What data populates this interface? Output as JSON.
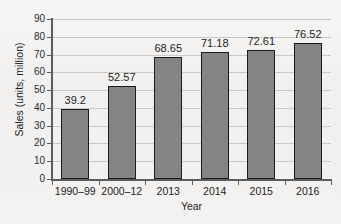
{
  "chart_data": {
    "type": "bar",
    "title": "",
    "subtitle": "",
    "xlabel": "Year",
    "ylabel": "Sales (units, million)",
    "categories": [
      "1990–99",
      "2000–12",
      "2013",
      "2014",
      "2015",
      "2016"
    ],
    "values": [
      39.2,
      52.57,
      68.65,
      71.18,
      72.61,
      76.52
    ],
    "value_labels": [
      "39.2",
      "52.57",
      "68.65",
      "71.18",
      "72.61",
      "76.52"
    ],
    "series": [
      {
        "name": "Sales",
        "values": [
          39.2,
          52.57,
          68.65,
          71.18,
          72.61,
          76.52
        ]
      }
    ],
    "ylim": [
      0,
      90
    ],
    "ytick_step": 10,
    "ytick_labels": [
      "0",
      "10",
      "20",
      "30",
      "40",
      "50",
      "60",
      "70",
      "80",
      "90"
    ],
    "grid": "horizontal",
    "legend": "none",
    "bar_color": "#848484",
    "bar_edge_color": "#1c1c1c",
    "gridline_color": "#c9c8c6",
    "axis_color": "#5d5c5a",
    "text_color": "#232323",
    "background_color": "#f3f2f0"
  }
}
